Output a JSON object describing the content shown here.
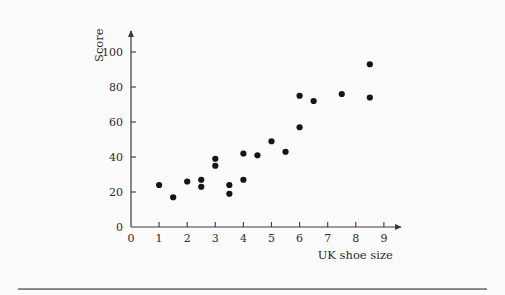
{
  "figure": {
    "background_color": "#fbfbfb",
    "axis_color": "#3a3a3a",
    "point_color": "#151515",
    "rule_color": "#8a8a8a"
  },
  "chart_data": {
    "type": "scatter",
    "title": "",
    "xlabel": "UK shoe size",
    "ylabel": "Score",
    "xlim": [
      0,
      9.6
    ],
    "ylim": [
      0,
      112
    ],
    "grid": false,
    "legend": null,
    "xticks": [
      0,
      1,
      2,
      3,
      4,
      5,
      6,
      7,
      8,
      9
    ],
    "xticklabels": [
      "0",
      "1",
      "2",
      "3",
      "4",
      "5",
      "6",
      "7",
      "8",
      "9"
    ],
    "yticks": [
      0,
      20,
      40,
      60,
      80,
      100
    ],
    "yticklabels": [
      "0",
      "20",
      "40",
      "60",
      "80",
      "100"
    ],
    "marker": "circle",
    "marker_size": 4,
    "points": [
      {
        "x": 1.0,
        "y": 24
      },
      {
        "x": 1.5,
        "y": 17
      },
      {
        "x": 2.0,
        "y": 26
      },
      {
        "x": 2.5,
        "y": 27
      },
      {
        "x": 2.5,
        "y": 23
      },
      {
        "x": 3.0,
        "y": 39
      },
      {
        "x": 3.0,
        "y": 35
      },
      {
        "x": 3.5,
        "y": 24
      },
      {
        "x": 3.5,
        "y": 19
      },
      {
        "x": 4.0,
        "y": 42
      },
      {
        "x": 4.0,
        "y": 27
      },
      {
        "x": 4.5,
        "y": 41
      },
      {
        "x": 5.0,
        "y": 49
      },
      {
        "x": 5.5,
        "y": 43
      },
      {
        "x": 6.0,
        "y": 75
      },
      {
        "x": 6.0,
        "y": 57
      },
      {
        "x": 6.5,
        "y": 72
      },
      {
        "x": 7.5,
        "y": 76
      },
      {
        "x": 8.5,
        "y": 93
      },
      {
        "x": 8.5,
        "y": 74
      }
    ]
  }
}
